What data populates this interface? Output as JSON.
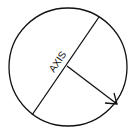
{
  "diagram": {
    "axis_label": "AXIS",
    "stroke_color": "#111111",
    "background": "#ffffff"
  }
}
